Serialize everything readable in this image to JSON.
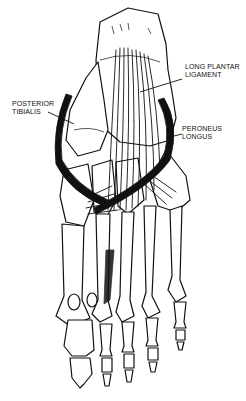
{
  "figure": {
    "style": "black-and-white line drawing",
    "background": "#ffffff",
    "ink": "#111111"
  },
  "labels": {
    "long_plantar_ligament": {
      "line1": "LONG PLANTAR",
      "line2": "LIGAMENT"
    },
    "posterior_tibialis": {
      "line1": "POSTERIOR",
      "line2": "TIBIALIS"
    },
    "peroneus_longus": {
      "line1": "PERONEUS",
      "line2": "LONGUS"
    }
  }
}
